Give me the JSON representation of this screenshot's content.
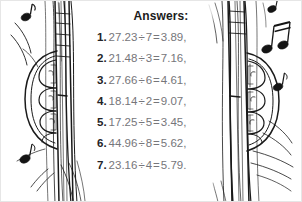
{
  "page": {
    "kind": "worksheet-answer-key",
    "background_color": "#ffffff",
    "border_color": "#e6e6e6",
    "width": 302,
    "height": 202
  },
  "header": {
    "title": "Answers:",
    "title_color": "#1b1b1b"
  },
  "answers": {
    "text_color": "#6f6f72",
    "number_color": "#232327",
    "items": [
      {
        "num": "1.",
        "dividend": "27.23",
        "operator": "÷",
        "divisor": "7",
        "equals": "=",
        "result": "3.89",
        "trailing": ",",
        "full": "1. 27.23 ÷ 7 = 3.89,"
      },
      {
        "num": "2.",
        "dividend": "21.48",
        "operator": "÷",
        "divisor": "3",
        "equals": "=",
        "result": "7.16",
        "trailing": ",",
        "full": "2. 21.48 ÷ 3 = 7.16,"
      },
      {
        "num": "3.",
        "dividend": "27.66",
        "operator": "÷",
        "divisor": "6",
        "equals": "=",
        "result": "4.61",
        "trailing": ",",
        "full": "3. 27.66 ÷ 6 = 4.61,"
      },
      {
        "num": "4.",
        "dividend": "18.14",
        "operator": "÷",
        "divisor": "2",
        "equals": "=",
        "result": "9.07",
        "trailing": ",",
        "full": "4. 18.14 ÷ 2 = 9.07,"
      },
      {
        "num": "5.",
        "dividend": "17.25",
        "operator": "÷",
        "divisor": "5",
        "equals": "=",
        "result": "3.45",
        "trailing": ",",
        "full": "5. 17.25 ÷ 5 = 3.45,"
      },
      {
        "num": "6.",
        "dividend": "44.96",
        "operator": "÷",
        "divisor": "8",
        "equals": "=",
        "result": "5.62",
        "trailing": ",",
        "full": "6. 44.96 ÷ 8 = 5.62,"
      },
      {
        "num": "7.",
        "dividend": "23.16",
        "operator": "÷",
        "divisor": "4",
        "equals": "=",
        "result": "5.79",
        "trailing": ".",
        "full": "7. 23.16 ÷ 4 = 5.79."
      }
    ]
  },
  "illustration": {
    "description": "line-drawing of two hands gripping a guitar neck with music notes",
    "ink_color": "#1a1a1a",
    "elements": [
      "guitar-neck-left",
      "guitar-neck-right",
      "hand-left",
      "hand-right",
      "music-note-top-left",
      "music-note-bottom-left",
      "beamed-eighth-notes-top-right",
      "music-note-right",
      "motion-lines"
    ]
  }
}
